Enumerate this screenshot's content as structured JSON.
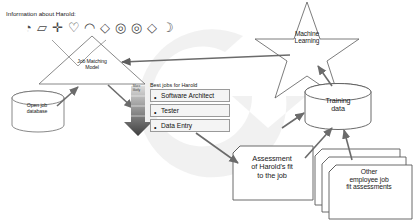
{
  "diagram": {
    "header_label": "Information about Harold:",
    "icons": [
      {
        "name": "pie-slice-icon",
        "glyph": "◔"
      },
      {
        "name": "parallelogram-icon",
        "glyph": "▱"
      },
      {
        "name": "cross-icon",
        "glyph": "✛"
      },
      {
        "name": "heart-icon",
        "glyph": "♡"
      },
      {
        "name": "droplet-icon",
        "glyph": "◠"
      },
      {
        "name": "diamond-icon",
        "glyph": "◇"
      },
      {
        "name": "target-icon",
        "glyph": "◎"
      },
      {
        "name": "target-icon-2",
        "glyph": "◎"
      },
      {
        "name": "diamond-icon-2",
        "glyph": "◇"
      },
      {
        "name": "crescent-icon",
        "glyph": "☽"
      }
    ],
    "model": {
      "label_line_1": "Job Matching",
      "label_line_2": "Model",
      "label": "Job Matching Model"
    },
    "database": {
      "label_line_1": "Open job",
      "label_line_2": "database",
      "label": "Open job database"
    },
    "results": {
      "header": "Best jobs for Harold",
      "ranking_hint_line_1": "More",
      "ranking_hint_line_2": "likely",
      "items": [
        {
          "bullet": "•",
          "label": "Software Architect"
        },
        {
          "bullet": "•",
          "label": "Tester"
        },
        {
          "bullet": "•",
          "label": "Data Entry"
        }
      ]
    },
    "machine_learning": {
      "label_line_1": "Machine",
      "label_line_2": "Learning",
      "label": "Machine Learning"
    },
    "training_data": {
      "label_line_1": "Training",
      "label_line_2": "data",
      "label": "Training data"
    },
    "assessment": {
      "label_line_1": "Assessment",
      "label_line_2": "of Harold's fit",
      "label_line_3": "to the job",
      "label": "Assessment of Harold's fit to the job"
    },
    "other_assessments": {
      "label_line_1": "Other",
      "label_line_2": "employee job",
      "label_line_3": "fit assessments",
      "label": "Other employee job fit assessments"
    },
    "colors": {
      "background": "#ffffff",
      "cycle_arrow": "#e8e8e8",
      "shape_stroke": "#5a5a5a",
      "arrow": "#6b6b6b",
      "arrow_dark": "#5e5e5e",
      "box_fill": "#f4f4f4",
      "box_border": "#9a9a9a",
      "text": "#1a1a1a",
      "gradient_top": "#d8d8d8",
      "gradient_bottom": "#4a4a4a"
    }
  }
}
